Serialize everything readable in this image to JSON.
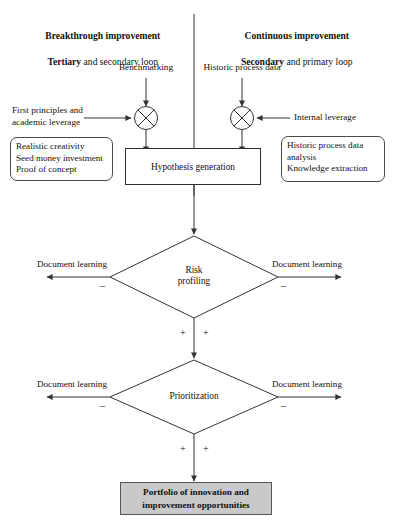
{
  "figure": {
    "type": "flowchart",
    "background": "#ffffff",
    "line_color": "#333333",
    "accent_fill": "#c9c9c9"
  },
  "headers": {
    "left": {
      "line1_bold": "Breakthrough improvement",
      "line2_bold": "Tertiary",
      "line2_rest": " and secondary loop"
    },
    "right": {
      "line1_bold": "Continuous improvement",
      "line2_bold": "Secondary",
      "line2_rest": " and primary loop"
    }
  },
  "inputs": {
    "top_left": "Benchmarking",
    "top_right": "Historic process data",
    "side_left": "First principles and\nacademic leverage",
    "side_right": "Internal leverage"
  },
  "notes": {
    "left": "Realistic creativity\nSeed money investment\nProof of concept",
    "right": "Historic process data\nanalysis\nKnowledge extraction"
  },
  "nodes": {
    "hypothesis": "Hypothesis generation",
    "risk": "Risk\nprofiling",
    "prioritization": "Prioritization",
    "portfolio": "Portfolio of innovation and\nimprovement opportunities"
  },
  "branches": {
    "risk_left_label": "Document learning",
    "risk_right_label": "Document learning",
    "prior_left_label": "Document learning",
    "prior_right_label": "Document learning",
    "negative_sign": "–",
    "positive_sign": "+"
  },
  "junctions": {
    "left_name": "crossed-circle-sum",
    "right_name": "crossed-circle-sum"
  }
}
